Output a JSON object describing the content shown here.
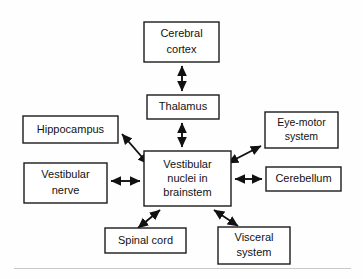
{
  "diagram": {
    "type": "block-diagram",
    "background_color": "#fefefe",
    "line_color": "#111111",
    "box_fill": "#ffffff",
    "footer_rule_color": "#c8c8c8",
    "nodes": [
      {
        "id": "cerebral-cortex",
        "lines": [
          "Cerebral",
          "cortex"
        ],
        "line1": "Cerebral",
        "line2": "cortex",
        "x": 144,
        "y": 22,
        "w": 75,
        "h": 40
      },
      {
        "id": "thalamus",
        "lines": [
          "Thalamus"
        ],
        "line1": "Thalamus",
        "x": 147,
        "y": 95,
        "w": 72,
        "h": 24
      },
      {
        "id": "vestibular-nuclei",
        "lines": [
          "Vestibular",
          "nuclei in",
          "brainstem"
        ],
        "line1": "Vestibular",
        "line2": "nuclei in",
        "line3": "brainstem",
        "x": 144,
        "y": 151,
        "w": 87,
        "h": 55
      },
      {
        "id": "hippocampus",
        "lines": [
          "Hippocampus"
        ],
        "line1": "Hippocampus",
        "x": 23,
        "y": 116,
        "w": 95,
        "h": 27
      },
      {
        "id": "vestibular-nerve",
        "lines": [
          "Vestibular",
          "nerve"
        ],
        "line1": "Vestibular",
        "line2": "nerve",
        "x": 24,
        "y": 163,
        "w": 83,
        "h": 40
      },
      {
        "id": "eye-motor-system",
        "lines": [
          "Eye-motor",
          "system"
        ],
        "line1": "Eye-motor",
        "line2": "system",
        "x": 265,
        "y": 112,
        "w": 73,
        "h": 36
      },
      {
        "id": "cerebellum",
        "lines": [
          "Cerebellum"
        ],
        "line1": "Cerebellum",
        "x": 266,
        "y": 167,
        "w": 75,
        "h": 24
      },
      {
        "id": "spinal-cord",
        "lines": [
          "Spinal cord"
        ],
        "line1": "Spinal cord",
        "x": 105,
        "y": 228,
        "w": 81,
        "h": 25
      },
      {
        "id": "visceral-system",
        "lines": [
          "Visceral",
          "system"
        ],
        "line1": "Visceral",
        "line2": "system",
        "x": 218,
        "y": 227,
        "w": 72,
        "h": 37
      }
    ],
    "edges": [
      {
        "id": "cortex-thalamus",
        "from": "cerebral-cortex",
        "to": "thalamus",
        "direction": "bidirectional",
        "orientation": "vertical"
      },
      {
        "id": "thalamus-nuclei",
        "from": "thalamus",
        "to": "vestibular-nuclei",
        "direction": "bidirectional",
        "orientation": "vertical"
      },
      {
        "id": "hippocampus-nuclei",
        "from": "hippocampus",
        "to": "vestibular-nuclei",
        "direction": "bidirectional",
        "orientation": "diagonal"
      },
      {
        "id": "vestibular-nerve-nuclei",
        "from": "vestibular-nerve",
        "to": "vestibular-nuclei",
        "direction": "bidirectional",
        "orientation": "horizontal"
      },
      {
        "id": "nuclei-eye-motor",
        "from": "vestibular-nuclei",
        "to": "eye-motor-system",
        "direction": "bidirectional",
        "orientation": "diagonal"
      },
      {
        "id": "nuclei-cerebellum",
        "from": "vestibular-nuclei",
        "to": "cerebellum",
        "direction": "bidirectional",
        "orientation": "horizontal"
      },
      {
        "id": "nuclei-spinal-cord",
        "from": "vestibular-nuclei",
        "to": "spinal-cord",
        "direction": "bidirectional",
        "orientation": "diagonal"
      },
      {
        "id": "nuclei-visceral",
        "from": "vestibular-nuclei",
        "to": "visceral-system",
        "direction": "bidirectional",
        "orientation": "diagonal"
      }
    ]
  }
}
